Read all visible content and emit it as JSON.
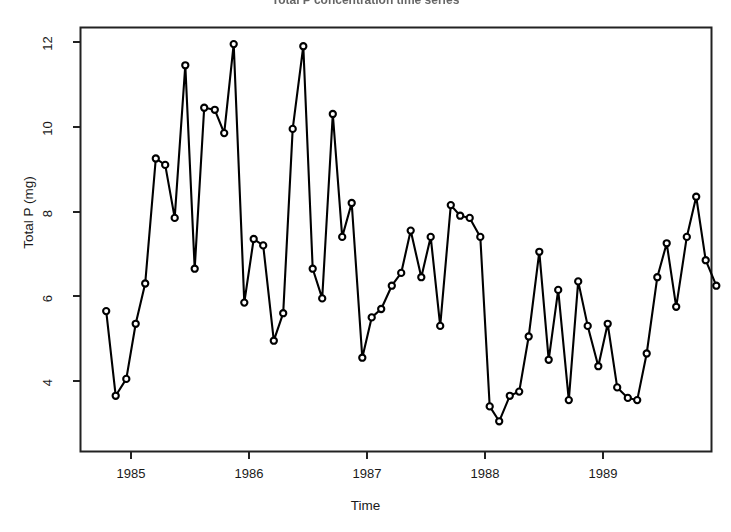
{
  "chart_data": {
    "type": "line",
    "title": "Total P concentration time series",
    "xlabel": "Time",
    "ylabel": "Total P (mg)",
    "xlim": [
      1984.72,
      1990.0
    ],
    "ylim": [
      2.85,
      12.35
    ],
    "x_tick_labels": [
      "1985",
      "1986",
      "1987",
      "1988",
      "1989"
    ],
    "x_tick_values": [
      1985,
      1986,
      1987,
      1988,
      1989
    ],
    "y_tick_labels": [
      "4",
      "6",
      "8",
      "10",
      "12"
    ],
    "y_tick_values": [
      4,
      6,
      8,
      10,
      12
    ],
    "grid": false,
    "legend": null,
    "marker": "open-circle",
    "line_color": "#000000",
    "marker_color": "#000000",
    "background": "#ffffff",
    "series": [
      {
        "name": "Total P",
        "x": [
          1984.79,
          1984.87,
          1984.96,
          1985.04,
          1985.12,
          1985.21,
          1985.29,
          1985.37,
          1985.46,
          1985.54,
          1985.62,
          1985.71,
          1985.79,
          1985.87,
          1985.96,
          1986.04,
          1986.12,
          1986.21,
          1986.29,
          1986.37,
          1986.46,
          1986.54,
          1986.62,
          1986.71,
          1986.79,
          1986.87,
          1986.96,
          1987.04,
          1987.12,
          1987.21,
          1987.29,
          1987.37,
          1987.46,
          1987.54,
          1987.62,
          1987.71,
          1987.79,
          1987.87,
          1987.96,
          1988.04,
          1988.12,
          1988.21,
          1988.29,
          1988.37,
          1988.46,
          1988.54,
          1988.62,
          1988.71,
          1988.79,
          1988.87,
          1988.96,
          1989.04,
          1989.12,
          1989.21,
          1989.29,
          1989.37,
          1989.46,
          1989.54,
          1989.62,
          1989.71
        ],
        "values": [
          5.65,
          3.65,
          4.05,
          5.35,
          6.3,
          9.25,
          9.1,
          7.85,
          11.45,
          6.65,
          10.45,
          10.4,
          9.85,
          11.95,
          5.85,
          7.35,
          7.2,
          4.95,
          5.6,
          9.95,
          11.9,
          6.65,
          5.95,
          10.3,
          7.4,
          8.2,
          4.55,
          5.5,
          5.7,
          6.25,
          6.55,
          7.55,
          6.45,
          7.4,
          5.3,
          8.15,
          7.9,
          7.85,
          7.4,
          3.4,
          3.05,
          3.65,
          3.75,
          5.05,
          7.05,
          4.5,
          6.15,
          3.55,
          6.35,
          5.3,
          4.35,
          5.35,
          3.85,
          3.6,
          3.55,
          4.65,
          6.45,
          7.25,
          5.75,
          7.4
        ]
      }
    ],
    "extra_points": {
      "note": "final rise",
      "x": [
        1989.79,
        1989.87,
        1989.96
      ],
      "values": [
        8.35,
        6.85,
        6.25
      ]
    }
  },
  "axes": {
    "y_label": "Total P (mg)",
    "x_label": "Time"
  }
}
